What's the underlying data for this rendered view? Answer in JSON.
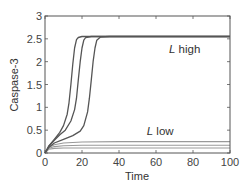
{
  "chart_data": {
    "type": "line",
    "title": "",
    "xlabel": "Time",
    "ylabel": "Caspase-3",
    "xlim": [
      0,
      100
    ],
    "ylim": [
      0,
      3
    ],
    "xticks": [
      0,
      20,
      40,
      60,
      80,
      100
    ],
    "yticks": [
      0,
      0.5,
      1,
      1.5,
      2,
      2.5,
      3
    ],
    "xtick_labels": [
      "0",
      "20",
      "40",
      "60",
      "80",
      "100"
    ],
    "ytick_labels": [
      "0",
      "0.5",
      "1",
      "1.5",
      "2",
      "2.5",
      "3"
    ],
    "grid": false,
    "legend": null,
    "annotations": [
      {
        "text_italic": "L",
        "text": " high",
        "x": 67,
        "y": 2.2
      },
      {
        "text_italic": "L",
        "text": " low",
        "x": 55,
        "y": 0.4
      }
    ],
    "series": [
      {
        "name": "L high 1",
        "group": "high",
        "color": "#555555",
        "x": [
          0,
          2,
          5,
          8,
          10,
          12,
          13,
          14,
          15,
          16,
          17,
          18,
          20,
          25,
          30,
          40,
          60,
          80,
          100
        ],
        "y": [
          0,
          0.15,
          0.3,
          0.45,
          0.6,
          0.85,
          1.1,
          1.5,
          1.95,
          2.3,
          2.48,
          2.53,
          2.55,
          2.55,
          2.55,
          2.55,
          2.55,
          2.55,
          2.55
        ]
      },
      {
        "name": "L high 2",
        "group": "high",
        "color": "#555555",
        "x": [
          0,
          2,
          5,
          8,
          11,
          14,
          16,
          17,
          18,
          19,
          20,
          21,
          22,
          25,
          30,
          40,
          60,
          80,
          100
        ],
        "y": [
          0,
          0.15,
          0.28,
          0.4,
          0.5,
          0.7,
          0.95,
          1.2,
          1.6,
          2.0,
          2.3,
          2.47,
          2.53,
          2.55,
          2.55,
          2.55,
          2.55,
          2.55,
          2.55
        ]
      },
      {
        "name": "L high 3",
        "group": "high",
        "color": "#555555",
        "x": [
          0,
          2,
          5,
          10,
          15,
          19,
          21,
          23,
          24,
          25,
          26,
          27,
          28,
          30,
          35,
          40,
          60,
          80,
          100
        ],
        "y": [
          0,
          0.12,
          0.22,
          0.3,
          0.38,
          0.48,
          0.6,
          0.9,
          1.2,
          1.6,
          2.0,
          2.3,
          2.47,
          2.54,
          2.55,
          2.55,
          2.55,
          2.55,
          2.55
        ]
      },
      {
        "name": "L low 1",
        "group": "low",
        "color": "#999999",
        "x": [
          0,
          2,
          5,
          10,
          20,
          40,
          60,
          80,
          100
        ],
        "y": [
          0,
          0.12,
          0.18,
          0.22,
          0.24,
          0.25,
          0.25,
          0.25,
          0.25
        ]
      },
      {
        "name": "L low 2",
        "group": "low",
        "color": "#999999",
        "x": [
          0,
          2,
          5,
          10,
          20,
          40,
          60,
          80,
          100
        ],
        "y": [
          0,
          0.1,
          0.14,
          0.16,
          0.17,
          0.17,
          0.17,
          0.17,
          0.17
        ]
      },
      {
        "name": "L low 3",
        "group": "low",
        "color": "#999999",
        "x": [
          0,
          2,
          5,
          10,
          20,
          40,
          60,
          80,
          100
        ],
        "y": [
          0,
          0.08,
          0.1,
          0.11,
          0.11,
          0.11,
          0.11,
          0.11,
          0.11
        ]
      }
    ]
  }
}
